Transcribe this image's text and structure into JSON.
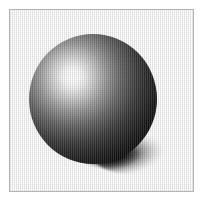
{
  "image": {
    "title": "Shaded sphere with drop shadow",
    "width": 204,
    "height": 207,
    "background_color": "#ffffff",
    "rendering_style": "dithered grayscale raytrace",
    "alt_text": "A grayscale shaded sphere lit from the upper left, casting a soft shadow to the lower right, inside a thin gray rectangular border."
  },
  "frame": {
    "name": "image-border",
    "stroke_color": "#b4b4b4",
    "stroke_width": 1,
    "x": 9,
    "y": 9,
    "width": 185,
    "height": 183
  },
  "scene": {
    "name": "rendered-scene",
    "background_color": "#ffffff",
    "objects": [
      {
        "name": "sphere",
        "type": "sphere",
        "center_x": 93,
        "center_y": 98,
        "radius": 64,
        "highlight_x": 73,
        "highlight_y": 76,
        "highlight_color": "#ffffff",
        "shade_color": "#030303",
        "material": "glossy grayscale"
      },
      {
        "name": "drop-shadow",
        "type": "ellipse",
        "center_x": 139,
        "center_y": 154,
        "width": 88,
        "height": 38,
        "rotation": -6,
        "color": "#000000",
        "falloff": "right-fading"
      }
    ],
    "light": {
      "name": "key-light",
      "direction": "upper-left",
      "color": "#ffffff"
    },
    "dither": {
      "name": "vertical-dither-pattern",
      "period_px": 2,
      "orientation": "vertical"
    }
  }
}
